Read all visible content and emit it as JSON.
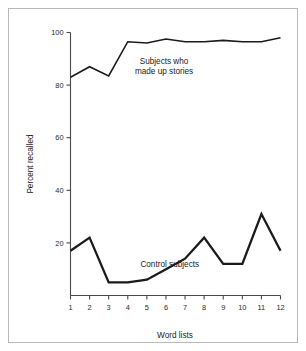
{
  "figure": {
    "frame_color": "#b9b9b9",
    "background": "#ffffff",
    "line_color": "#1b1b1b",
    "axis_color": "#4a4a4a"
  },
  "chart_data": {
    "type": "line",
    "title": "",
    "xlabel": "Word lists",
    "ylabel": "Percent recalled",
    "categories": [
      "1",
      "2",
      "3",
      "4",
      "5",
      "6",
      "7",
      "8",
      "9",
      "10",
      "11",
      "12"
    ],
    "x": [
      1,
      2,
      3,
      4,
      5,
      6,
      7,
      8,
      9,
      10,
      11,
      12
    ],
    "xlim": [
      1,
      12
    ],
    "ylim": [
      0,
      100
    ],
    "yticks": [
      20,
      40,
      60,
      80,
      100
    ],
    "ytick_labels": [
      "20",
      "40",
      "60",
      "80",
      "100"
    ],
    "xticks": [
      1,
      2,
      3,
      4,
      5,
      6,
      7,
      8,
      9,
      10,
      11,
      12
    ],
    "grid": false,
    "legend": "inline-annotations",
    "series": [
      {
        "name": "Subjects who made up stories",
        "values": [
          83,
          87,
          83.5,
          96.5,
          96,
          97.5,
          96.5,
          96.5,
          97,
          96.5,
          96.5,
          98
        ]
      },
      {
        "name": "Control subjects",
        "values": [
          17,
          22,
          5,
          5,
          6,
          10,
          14,
          22,
          12,
          12,
          31,
          17
        ]
      }
    ],
    "annotations": [
      {
        "name": "stories-annotation",
        "line1": "Subjects who",
        "line2": "made up stories",
        "x": 5.9,
        "y": 88
      },
      {
        "name": "control-annotation",
        "text": "Control subjects",
        "x": 6.2,
        "y": 11
      }
    ]
  }
}
